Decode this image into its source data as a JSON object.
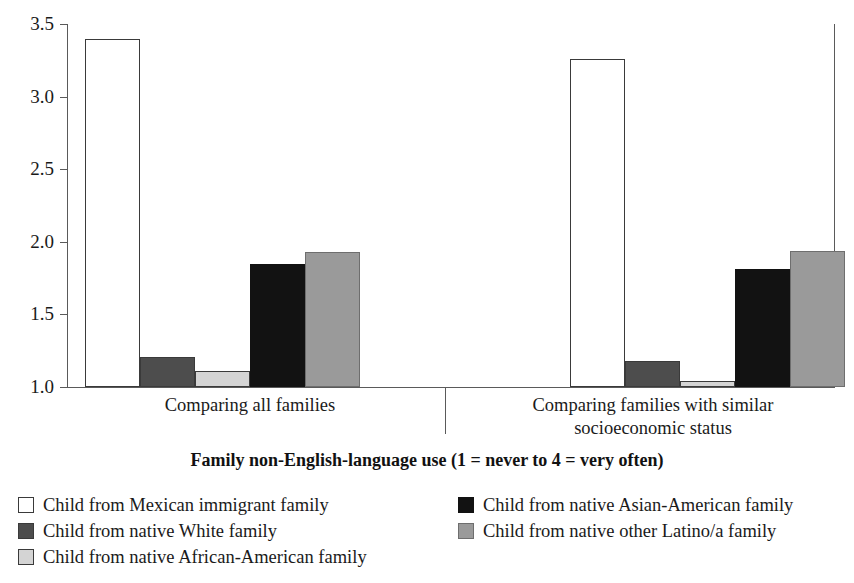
{
  "chart_data": {
    "type": "bar",
    "title": "",
    "subtitle": "",
    "xlabel": "Family non-English-language use (1 = never to 4 = very often)",
    "ylabel": "",
    "ylim": [
      1.0,
      3.5
    ],
    "yticks": [
      "1.0",
      "1.5",
      "2.0",
      "2.5",
      "3.0",
      "3.5"
    ],
    "ytick_values": [
      1.0,
      1.5,
      2.0,
      2.5,
      3.0,
      3.5
    ],
    "grid": false,
    "legend_position": "bottom",
    "categories": [
      "Comparing all families",
      "Comparing families with similar socioeconomic status"
    ],
    "series": [
      {
        "name": "Child from Mexican immigrant family",
        "color": "#ffffff",
        "swatch": "white",
        "values": [
          3.4,
          3.26
        ]
      },
      {
        "name": "Child from native White family",
        "color": "#4d4d4d",
        "swatch": "darkgray",
        "values": [
          1.21,
          1.18
        ]
      },
      {
        "name": "Child from native African-American family",
        "color": "#d4d4d4",
        "swatch": "lightgray",
        "values": [
          1.11,
          1.04
        ]
      },
      {
        "name": "Child from native Asian-American family",
        "color": "#121212",
        "swatch": "black",
        "values": [
          1.85,
          1.81
        ]
      },
      {
        "name": "Child from native other Latino/a family",
        "color": "#9a9a9a",
        "swatch": "gray",
        "values": [
          1.93,
          1.94
        ]
      }
    ]
  },
  "axis": {
    "tick_labels": [
      "3.5",
      "3.0",
      "2.5",
      "2.0",
      "1.5",
      "1.0"
    ]
  },
  "groups": [
    {
      "label_line1": "Comparing all families",
      "label_line2": ""
    },
    {
      "label_line1": "Comparing families with similar",
      "label_line2": "socioeconomic status"
    }
  ],
  "caption": "Family non-English-language use (1 = never to 4 = very often)",
  "legend": {
    "left_column": [
      {
        "label": "Child from Mexican immigrant family",
        "swatch": "white"
      },
      {
        "label": "Child from native White family",
        "swatch": "darkgray"
      },
      {
        "label": "Child from native African-American family",
        "swatch": "lightgray"
      }
    ],
    "right_column": [
      {
        "label": "Child from native Asian-American family",
        "swatch": "black"
      },
      {
        "label": "Child from native other Latino/a family",
        "swatch": "gray"
      }
    ]
  }
}
